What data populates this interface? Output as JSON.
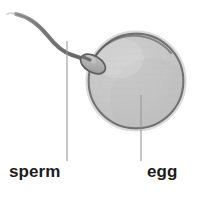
{
  "figure": {
    "background_color": "#ffffff",
    "width": 201,
    "height": 197
  },
  "labels": {
    "sperm": "sperm",
    "egg": "egg"
  },
  "colors": {
    "egg_fill": "#c6c6c6",
    "egg_fill_light": "#d8d8d8",
    "egg_outline": "#6a6a6a",
    "sperm_fill": "#b4b4b4",
    "sperm_outline": "#5e5e5e",
    "leader_line": "#9a9a9a",
    "text": "#1d1d1d",
    "background": "#ffffff"
  },
  "structures": {
    "egg": {
      "name": "egg",
      "shape": "circle",
      "center_x": 136,
      "center_y": 81,
      "radius": 48
    },
    "sperm": {
      "name": "sperm",
      "head_center_x": 93,
      "head_center_y": 64,
      "head_rx": 13,
      "head_ry": 8,
      "head_rotation_deg": 28,
      "tail_start_x": 16,
      "tail_start_y": 14
    }
  },
  "leader_lines": [
    {
      "name": "sperm-leader-line",
      "x": 67,
      "y_top": 41,
      "y_bottom": 161
    },
    {
      "name": "egg-leader-line",
      "x": 141,
      "y_top": 95,
      "y_bottom": 161
    }
  ]
}
